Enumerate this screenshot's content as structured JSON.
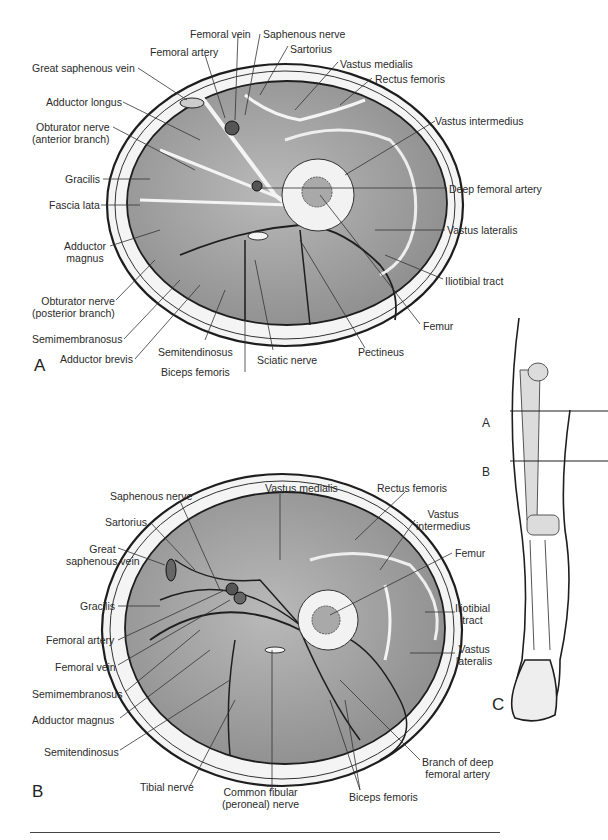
{
  "figure": {
    "panels": {
      "a": "A",
      "b": "B",
      "c": "C"
    },
    "section_a_labels": {
      "femoral_vein": "Femoral vein",
      "saphenous_nerve": "Saphenous nerve",
      "femoral_artery": "Femoral artery",
      "sartorius": "Sartorius",
      "great_saphenous_vein": "Great saphenous vein",
      "vastus_medialis": "Vastus medialis",
      "rectus_femoris": "Rectus femoris",
      "adductor_longus": "Adductor longus",
      "obturator_nerve_anterior_1": "Obturator nerve",
      "obturator_nerve_anterior_2": "(anterior branch)",
      "vastus_intermedius": "Vastus intermedius",
      "gracilis": "Gracilis",
      "deep_femoral_artery": "Deep femoral artery",
      "fascia_lata": "Fascia lata",
      "vastus_lateralis": "Vastus lateralis",
      "adductor_magnus_1": "Adductor",
      "adductor_magnus_2": "magnus",
      "iliotibial_tract": "Iliotibial tract",
      "obturator_nerve_posterior_1": "Obturator nerve",
      "obturator_nerve_posterior_2": "(posterior branch)",
      "femur": "Femur",
      "semimembranosus": "Semimembranosus",
      "adductor_brevis": "Adductor brevis",
      "semitendinosus": "Semitendinosus",
      "sciatic_nerve": "Sciatic nerve",
      "pectineus": "Pectineus",
      "biceps_femoris": "Biceps femoris"
    },
    "section_b_labels": {
      "saphenous_nerve": "Saphenous nerve",
      "vastus_medialis": "Vastus medialis",
      "rectus_femoris": "Rectus femoris",
      "sartorius": "Sartorius",
      "vastus_intermedius_1": "Vastus",
      "vastus_intermedius_2": "intermedius",
      "great_saphenous_vein_1": "Great",
      "great_saphenous_vein_2": "saphenous vein",
      "femur": "Femur",
      "gracilis": "Gracilis",
      "iliotibial_tract_1": "Iliotibial",
      "iliotibial_tract_2": "tract",
      "femoral_artery": "Femoral artery",
      "femoral_vein": "Femoral vein",
      "vastus_lateralis_1": "Vastus",
      "vastus_lateralis_2": "lateralis",
      "semimembranosus": "Semimembranosus",
      "adductor_magnus": "Adductor magnus",
      "semitendinosus": "Semitendinosus",
      "branch_deep_femoral_1": "Branch of deep",
      "branch_deep_femoral_2": "femoral artery",
      "tibial_nerve": "Tibial nerve",
      "common_fibular_1": "Common fibular",
      "common_fibular_2": "(peroneal) nerve",
      "biceps_femoris": "Biceps femoris"
    },
    "leg_markers": {
      "a": "A",
      "b": "B"
    },
    "colors": {
      "muscle": "#9a9a9a",
      "muscle_light": "#b4b4b4",
      "fat": "#f2f2f2",
      "bone": "#e8e8e8",
      "outline": "#1e1e1e"
    }
  }
}
